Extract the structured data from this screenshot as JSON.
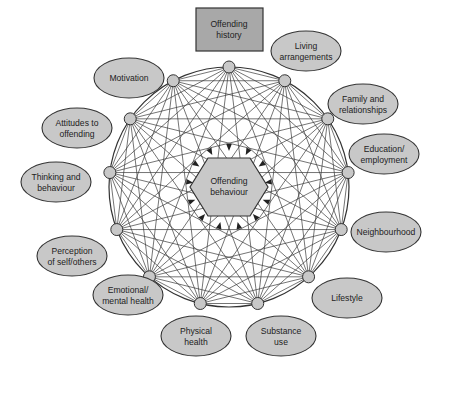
{
  "diagram": {
    "center": {
      "label_lines": [
        "Offending",
        "behaviour"
      ]
    },
    "top_box": {
      "label_lines": [
        "Offending",
        "history"
      ]
    },
    "factors": [
      {
        "id": "offending-history",
        "lines": [
          "Offending",
          "history"
        ],
        "shape": "rect"
      },
      {
        "id": "living-arrangements",
        "lines": [
          "Living",
          "arrangements"
        ]
      },
      {
        "id": "family-relationships",
        "lines": [
          "Family and",
          "relationships"
        ]
      },
      {
        "id": "education-employment",
        "lines": [
          "Education/",
          "employment"
        ]
      },
      {
        "id": "neighbourhood",
        "lines": [
          "Neighbourhood"
        ]
      },
      {
        "id": "lifestyle",
        "lines": [
          "Lifestyle"
        ]
      },
      {
        "id": "substance-use",
        "lines": [
          "Substance",
          "use"
        ]
      },
      {
        "id": "physical-health",
        "lines": [
          "Physical",
          "health"
        ]
      },
      {
        "id": "emotional-mental-health",
        "lines": [
          "Emotional/",
          "mental health"
        ]
      },
      {
        "id": "perception-self-others",
        "lines": [
          "Perception",
          "of self/others"
        ]
      },
      {
        "id": "thinking-behaviour",
        "lines": [
          "Thinking and",
          "behaviour"
        ]
      },
      {
        "id": "attitudes-offending",
        "lines": [
          "Attitudes to",
          "offending"
        ]
      },
      {
        "id": "motivation",
        "lines": [
          "Motivation"
        ]
      }
    ],
    "colors": {
      "fill": "#c8c8c8",
      "box_fill": "#a8a8a8",
      "stroke": "#333333",
      "line": "#3a3a3a"
    }
  }
}
